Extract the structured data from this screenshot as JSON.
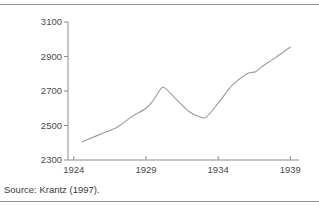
{
  "figure": {
    "source_note": "Source: Krantz (1997).",
    "line_color": "#9a9a9a",
    "axis_color": "#8c8c8c",
    "rule_color": "#8f8f8f",
    "text_color": "#4a4a4a",
    "background": "#ffffff"
  },
  "chart_data": {
    "type": "line",
    "title": "",
    "subtitle": "",
    "xlabel": "",
    "ylabel": "",
    "grid": false,
    "legend": null,
    "xlim": [
      1923.6,
      1939.6
    ],
    "ylim": [
      2300,
      3100
    ],
    "xticks": [
      1924,
      1929,
      1934,
      1939
    ],
    "xtick_labels": [
      "1924",
      "1929",
      "1934",
      "1939"
    ],
    "yticks": [
      2300,
      2500,
      2700,
      2900,
      3100
    ],
    "ytick_labels": [
      "2300",
      "2500",
      "2700",
      "2900",
      "3100"
    ],
    "x": [
      1924.6,
      1925,
      1926,
      1927,
      1928,
      1929,
      1929.5,
      1930,
      1930.3,
      1931,
      1932,
      1932.8,
      1933.2,
      1934,
      1935,
      1936,
      1936.6,
      1937,
      1938,
      1939
    ],
    "values": [
      2405,
      2420,
      2455,
      2490,
      2550,
      2600,
      2645,
      2710,
      2718,
      2660,
      2580,
      2548,
      2550,
      2630,
      2735,
      2800,
      2812,
      2840,
      2895,
      2955
    ],
    "series": [
      {
        "name": "index",
        "x": [
          1924.6,
          1925,
          1926,
          1927,
          1928,
          1929,
          1929.5,
          1930,
          1930.3,
          1931,
          1932,
          1932.8,
          1933.2,
          1934,
          1935,
          1936,
          1936.6,
          1937,
          1938,
          1939
        ],
        "values": [
          2405,
          2420,
          2455,
          2490,
          2550,
          2600,
          2645,
          2710,
          2718,
          2660,
          2580,
          2548,
          2550,
          2630,
          2735,
          2800,
          2812,
          2840,
          2895,
          2955
        ]
      }
    ],
    "annotations": []
  }
}
